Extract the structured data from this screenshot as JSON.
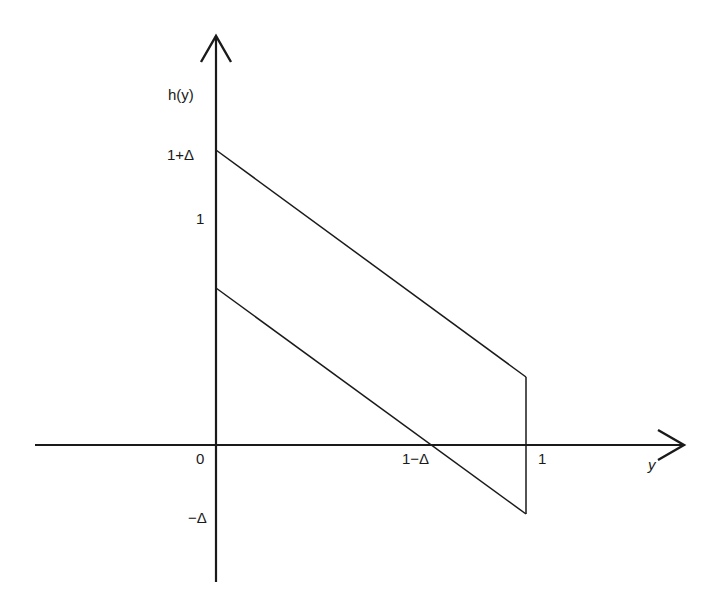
{
  "diagram": {
    "type": "function-plot",
    "y_axis_label": "h(y)",
    "x_axis_label": "y",
    "tick_labels": {
      "origin": "0",
      "one_plus_delta": "1+Δ",
      "one_y": "1",
      "minus_delta": "−Δ",
      "one_minus_delta": "1−Δ",
      "one_x": "1"
    },
    "shapes": [
      {
        "name": "upper-line",
        "from": [
          0,
          "1+Δ"
        ],
        "to": [
          1,
          "Δ"
        ]
      },
      {
        "name": "lower-line",
        "from": [
          0,
          "1−Δ"
        ],
        "to": [
          1,
          "−Δ"
        ]
      },
      {
        "name": "right-edge",
        "at_y": 1,
        "from": "−Δ",
        "to": "Δ"
      }
    ],
    "colors": {
      "line": "#1a1a1a",
      "background": "#ffffff"
    }
  }
}
